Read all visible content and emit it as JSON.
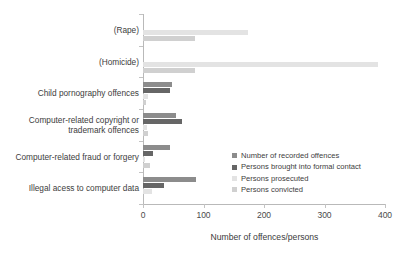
{
  "chart_data": {
    "type": "bar",
    "orientation": "horizontal",
    "title": "",
    "xlabel": "Number of offences/persons",
    "ylabel": "",
    "xlim": [
      0,
      400
    ],
    "xticks": [
      0,
      100,
      200,
      300,
      400
    ],
    "grid": false,
    "legend_position": "inside-right",
    "categories": [
      "(Rape)",
      "(Homicide)",
      "Child pornography offences",
      "Computer-related copyright or trademark offences",
      "Computer-related fraud or forgery",
      "Illegal acess to  computer data"
    ],
    "series": [
      {
        "name": "Number of recorded offences",
        "color": "#8c8c8c",
        "values": [
          0,
          0,
          48,
          55,
          45,
          88
        ]
      },
      {
        "name": "Persons brought into formal contact",
        "color": "#666666",
        "values": [
          0,
          0,
          45,
          65,
          17,
          35
        ]
      },
      {
        "name": "Persons prosecuted",
        "color": "#e3e3e3",
        "values": [
          173,
          388,
          8,
          6,
          4,
          15
        ]
      },
      {
        "name": "Persons convicted",
        "color": "#d0d0d0",
        "values": [
          86,
          86,
          5,
          9,
          12,
          0
        ]
      }
    ]
  },
  "legend": {
    "items": [
      {
        "label": "Number of recorded offences",
        "color": "#8c8c8c"
      },
      {
        "label": "Persons brought into formal contact",
        "color": "#666666"
      },
      {
        "label": "Persons prosecuted",
        "color": "#e3e3e3"
      },
      {
        "label": "Persons convicted",
        "color": "#d0d0d0"
      }
    ]
  },
  "axis": {
    "x_title": "Number of offences/persons"
  }
}
